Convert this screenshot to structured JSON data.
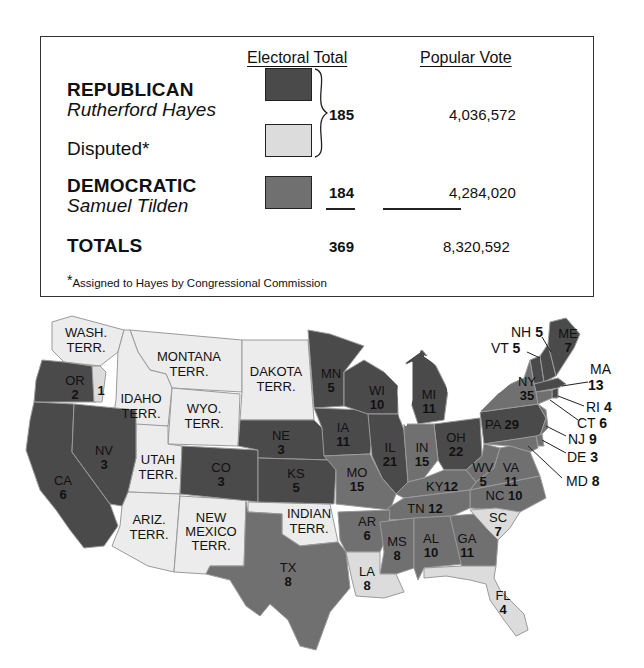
{
  "legend": {
    "columns": {
      "electoral": "Electoral Total",
      "popular": "Popular Vote"
    },
    "rows": [
      {
        "party": "REPUBLICAN",
        "candidate": "Rutherford Hayes",
        "color": "#4a4a4a"
      },
      {
        "party": "Disputed*",
        "candidate": "",
        "color": "#dcdcdc"
      },
      {
        "party": "DEMOCRATIC",
        "candidate": "Samuel Tilden",
        "color": "#707070"
      }
    ],
    "hayes_electoral": "185",
    "hayes_popular": "4,036,572",
    "tilden_electoral": "184",
    "tilden_popular": "4,284,020",
    "totals_label": "TOTALS",
    "totals_electoral": "369",
    "totals_popular": "8,320,592",
    "footnote_mark": "*",
    "footnote": "Assigned to Hayes by Congressional Commission"
  },
  "colors": {
    "republican": "#4a4a4a",
    "democratic": "#707070",
    "disputed": "#dcdcdc",
    "territory": "#ececec",
    "border": "#9a9a9a"
  },
  "map": {
    "territories": [
      {
        "abbr": "WASH.",
        "l2": "TERR."
      },
      {
        "abbr": "MONTANA",
        "l2": "TERR."
      },
      {
        "abbr": "DAKOTA",
        "l2": "TERR."
      },
      {
        "abbr": "IDAHO",
        "l2": "TERR."
      },
      {
        "abbr": "WYO.",
        "l2": "TERR."
      },
      {
        "abbr": "UTAH",
        "l2": "TERR."
      },
      {
        "abbr": "ARIZ.",
        "l2": "TERR."
      },
      {
        "abbr": "NEW",
        "l2": "MEXICO",
        "l3": "TERR."
      },
      {
        "abbr": "INDIAN",
        "l2": "TERR."
      }
    ],
    "states": {
      "OR": {
        "abbr": "OR",
        "votes": "2",
        "disputed_votes": "1",
        "winner": "republican"
      },
      "CA": {
        "abbr": "CA",
        "votes": "6",
        "winner": "republican"
      },
      "NV": {
        "abbr": "NV",
        "votes": "3",
        "winner": "republican"
      },
      "CO": {
        "abbr": "CO",
        "votes": "3",
        "winner": "republican"
      },
      "NE": {
        "abbr": "NE",
        "votes": "3",
        "winner": "republican"
      },
      "KS": {
        "abbr": "KS",
        "votes": "5",
        "winner": "republican"
      },
      "MN": {
        "abbr": "MN",
        "votes": "5",
        "winner": "republican"
      },
      "IA": {
        "abbr": "IA",
        "votes": "11",
        "winner": "republican"
      },
      "WI": {
        "abbr": "WI",
        "votes": "10",
        "winner": "republican"
      },
      "MI": {
        "abbr": "MI",
        "votes": "11",
        "winner": "republican"
      },
      "IL": {
        "abbr": "IL",
        "votes": "21",
        "winner": "republican"
      },
      "OH": {
        "abbr": "OH",
        "votes": "22",
        "winner": "republican"
      },
      "PA": {
        "abbr": "PA",
        "votes": "29",
        "winner": "republican"
      },
      "NY": {
        "abbr": "NY",
        "votes": "35",
        "winner": "democratic"
      },
      "IN": {
        "abbr": "IN",
        "votes": "15",
        "winner": "democratic"
      },
      "MO": {
        "abbr": "MO",
        "votes": "15",
        "winner": "democratic"
      },
      "KY": {
        "abbr": "KY",
        "votes": "12",
        "winner": "democratic"
      },
      "WV": {
        "abbr": "WV",
        "votes": "5",
        "winner": "democratic"
      },
      "VA": {
        "abbr": "VA",
        "votes": "11",
        "winner": "democratic"
      },
      "NC": {
        "abbr": "NC",
        "votes": "10",
        "winner": "democratic"
      },
      "TN": {
        "abbr": "TN",
        "votes": "12",
        "winner": "democratic"
      },
      "TX": {
        "abbr": "TX",
        "votes": "8",
        "winner": "democratic"
      },
      "AR": {
        "abbr": "AR",
        "votes": "6",
        "winner": "democratic"
      },
      "MS": {
        "abbr": "MS",
        "votes": "8",
        "winner": "democratic"
      },
      "AL": {
        "abbr": "AL",
        "votes": "10",
        "winner": "democratic"
      },
      "GA": {
        "abbr": "GA",
        "votes": "11",
        "winner": "democratic"
      },
      "LA": {
        "abbr": "LA",
        "votes": "8",
        "winner": "disputed"
      },
      "SC": {
        "abbr": "SC",
        "votes": "7",
        "winner": "disputed"
      },
      "FL": {
        "abbr": "FL",
        "votes": "4",
        "winner": "disputed"
      },
      "NH": {
        "abbr": "NH",
        "votes": "5",
        "winner": "republican"
      },
      "VT": {
        "abbr": "VT",
        "votes": "5",
        "winner": "republican"
      },
      "ME": {
        "abbr": "ME",
        "votes": "7",
        "winner": "republican"
      },
      "MA": {
        "abbr": "MA",
        "votes": "13",
        "winner": "republican"
      },
      "RI": {
        "abbr": "RI",
        "votes": "4",
        "winner": "republican"
      },
      "CT": {
        "abbr": "CT",
        "votes": "6",
        "winner": "democratic"
      },
      "NJ": {
        "abbr": "NJ",
        "votes": "9",
        "winner": "democratic"
      },
      "DE": {
        "abbr": "DE",
        "votes": "3",
        "winner": "democratic"
      },
      "MD": {
        "abbr": "MD",
        "votes": "8",
        "winner": "democratic"
      }
    }
  }
}
